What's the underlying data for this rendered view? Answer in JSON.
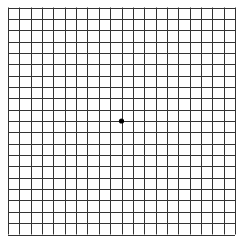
{
  "grid": {
    "rows": 20,
    "cols": 20,
    "left": 8,
    "top": 7.5,
    "size": 227,
    "line_color": "#333333",
    "line_width": 1,
    "background": "#ffffff"
  },
  "fixation_dot": {
    "cx": 121.5,
    "cy": 121,
    "r": 2.6,
    "color": "#000000"
  }
}
